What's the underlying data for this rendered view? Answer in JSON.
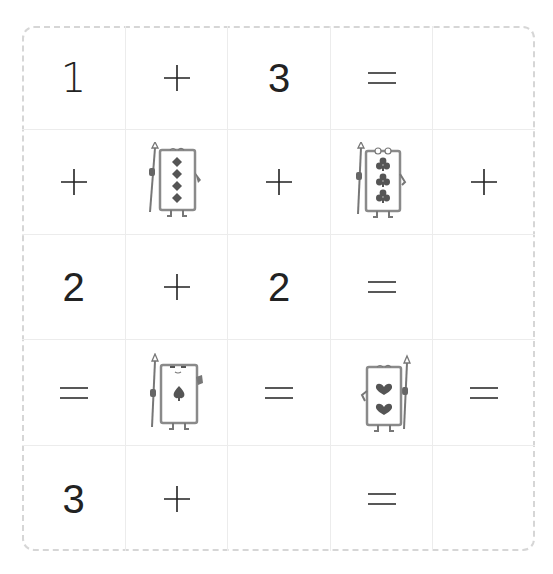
{
  "puzzle": {
    "rows": [
      [
        {
          "type": "number",
          "value": "1"
        },
        {
          "type": "operator",
          "value": "+",
          "icon": "plus-icon"
        },
        {
          "type": "number",
          "value": "3"
        },
        {
          "type": "operator",
          "value": "=",
          "icon": "equals-icon"
        },
        {
          "type": "empty",
          "value": ""
        }
      ],
      [
        {
          "type": "operator",
          "value": "+",
          "icon": "plus-icon"
        },
        {
          "type": "card",
          "suit": "diamond",
          "count": 4,
          "icon": "diamond-card-character-icon"
        },
        {
          "type": "operator",
          "value": "+",
          "icon": "plus-icon"
        },
        {
          "type": "card",
          "suit": "club",
          "count": 3,
          "icon": "club-card-character-icon"
        },
        {
          "type": "operator",
          "value": "+",
          "icon": "plus-icon"
        }
      ],
      [
        {
          "type": "number",
          "value": "2"
        },
        {
          "type": "operator",
          "value": "+",
          "icon": "plus-icon"
        },
        {
          "type": "number",
          "value": "2"
        },
        {
          "type": "operator",
          "value": "=",
          "icon": "equals-icon"
        },
        {
          "type": "empty",
          "value": ""
        }
      ],
      [
        {
          "type": "operator",
          "value": "=",
          "icon": "equals-icon"
        },
        {
          "type": "card",
          "suit": "spade",
          "count": 1,
          "icon": "spade-card-character-icon"
        },
        {
          "type": "operator",
          "value": "=",
          "icon": "equals-icon"
        },
        {
          "type": "card",
          "suit": "heart",
          "count": 2,
          "icon": "heart-card-character-icon"
        },
        {
          "type": "operator",
          "value": "=",
          "icon": "equals-icon"
        }
      ],
      [
        {
          "type": "number",
          "value": "3"
        },
        {
          "type": "operator",
          "value": "+",
          "icon": "plus-icon"
        },
        {
          "type": "empty",
          "value": ""
        },
        {
          "type": "operator",
          "value": "=",
          "icon": "equals-icon"
        },
        {
          "type": "empty",
          "value": ""
        }
      ]
    ]
  },
  "colors": {
    "text": "#222222",
    "grid_line": "#ececec",
    "dashed_border": "#d6d6d6",
    "card_outline": "#8a8a8a",
    "suit_fill": "#555555"
  }
}
